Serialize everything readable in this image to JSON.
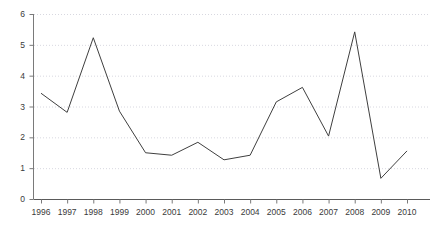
{
  "chart_data": {
    "type": "line",
    "title": "",
    "xlabel": "",
    "ylabel": "",
    "categories": [
      "1996",
      "1997",
      "1998",
      "1999",
      "2000",
      "2001",
      "2002",
      "2003",
      "2004",
      "2005",
      "2006",
      "2007",
      "2008",
      "2009",
      "2010"
    ],
    "values": [
      3.43,
      2.81,
      5.23,
      2.85,
      1.5,
      1.42,
      1.84,
      1.27,
      1.42,
      3.15,
      3.62,
      2.04,
      5.42,
      0.67,
      1.56
    ],
    "series": [
      {
        "name": "series-1",
        "values": [
          3.43,
          2.81,
          5.23,
          2.85,
          1.5,
          1.42,
          1.84,
          1.27,
          1.42,
          3.15,
          3.62,
          2.04,
          5.42,
          0.67,
          1.56
        ]
      }
    ],
    "ylim": [
      0,
      6
    ],
    "yticks": [
      0,
      1,
      2,
      3,
      4,
      5,
      6
    ],
    "ytick_labels": [
      "0",
      "1",
      "2",
      "3",
      "4",
      "5",
      "6"
    ],
    "xticks": [
      "1996",
      "1997",
      "1998",
      "1999",
      "2000",
      "2001",
      "2002",
      "2003",
      "2004",
      "2005",
      "2006",
      "2007",
      "2008",
      "2009",
      "2010"
    ],
    "grid": "horizontal-dotted",
    "legend": "none",
    "colors": {
      "line": "#3f3f3f",
      "grid": "#d8d8e0",
      "axis": "#7a7a7a",
      "tick_label": "#3a3a3a",
      "background": "#ffffff"
    }
  }
}
